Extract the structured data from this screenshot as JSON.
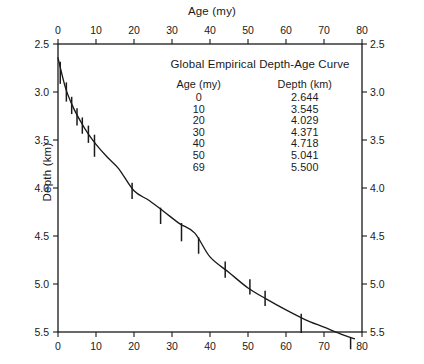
{
  "chart_data": {
    "type": "line",
    "title": "Global Empirical Depth-Age Curve",
    "xlabel": "Age (my)",
    "ylabel": "Depth (km)",
    "xlim": [
      0,
      80
    ],
    "ylim": [
      2.5,
      5.5
    ],
    "y_inverted": true,
    "grid": false,
    "legend_position": "inside-top-right",
    "x_ticks": [
      0,
      10,
      20,
      30,
      40,
      50,
      60,
      70,
      80
    ],
    "x_ticks_top": [
      0,
      10,
      20,
      30,
      40,
      50,
      60,
      70,
      80
    ],
    "y_ticks": [
      2.5,
      3.0,
      3.5,
      4.0,
      4.5,
      5.0,
      5.5
    ],
    "y_ticks_right": [
      2.5,
      3.0,
      3.5,
      4.0,
      4.5,
      5.0,
      5.5
    ],
    "table_headers": [
      "Age (my)",
      "Depth (km)"
    ],
    "table_rows": [
      {
        "age": "0",
        "depth": "2.644"
      },
      {
        "age": "10",
        "depth": "3.545"
      },
      {
        "age": "20",
        "depth": "4.029"
      },
      {
        "age": "30",
        "depth": "4.371"
      },
      {
        "age": "40",
        "depth": "4.718"
      },
      {
        "age": "50",
        "depth": "5.041"
      },
      {
        "age": "69",
        "depth": "5.500"
      }
    ],
    "series": [
      {
        "name": "Global Empirical Depth-Age Curve",
        "x": [
          0,
          2,
          4,
          6,
          8,
          10,
          13,
          16,
          20,
          24,
          28,
          32,
          36,
          40,
          45,
          50,
          55,
          60,
          65,
          70,
          75,
          78
        ],
        "y": [
          2.644,
          2.96,
          3.16,
          3.31,
          3.44,
          3.545,
          3.68,
          3.8,
          4.029,
          4.13,
          4.25,
          4.371,
          4.47,
          4.718,
          4.88,
          5.041,
          5.16,
          5.27,
          5.37,
          5.45,
          5.53,
          5.57
        ]
      }
    ],
    "error_bars": [
      {
        "x": 0.6,
        "y": 2.8,
        "half": 0.115
      },
      {
        "x": 2.2,
        "y": 3.0,
        "half": 0.1
      },
      {
        "x": 3.6,
        "y": 3.14,
        "half": 0.09
      },
      {
        "x": 5.0,
        "y": 3.26,
        "half": 0.09
      },
      {
        "x": 6.4,
        "y": 3.35,
        "half": 0.085
      },
      {
        "x": 8.0,
        "y": 3.44,
        "half": 0.09
      },
      {
        "x": 9.6,
        "y": 3.56,
        "half": 0.115
      },
      {
        "x": 19.5,
        "y": 4.03,
        "half": 0.085
      },
      {
        "x": 27.0,
        "y": 4.29,
        "half": 0.085
      },
      {
        "x": 32.5,
        "y": 4.46,
        "half": 0.095
      },
      {
        "x": 37.0,
        "y": 4.6,
        "half": 0.085
      },
      {
        "x": 44.0,
        "y": 4.85,
        "half": 0.085
      },
      {
        "x": 50.5,
        "y": 5.03,
        "half": 0.08
      },
      {
        "x": 54.5,
        "y": 5.15,
        "half": 0.08
      },
      {
        "x": 64.0,
        "y": 5.41,
        "half": 0.1
      },
      {
        "x": 77.0,
        "y": 5.62,
        "half": 0.06
      }
    ],
    "colors": {
      "background": "#ffffff",
      "axis": "#1a1a1a",
      "curve": "#1a1a1a",
      "text": "#1a1a1a"
    }
  }
}
